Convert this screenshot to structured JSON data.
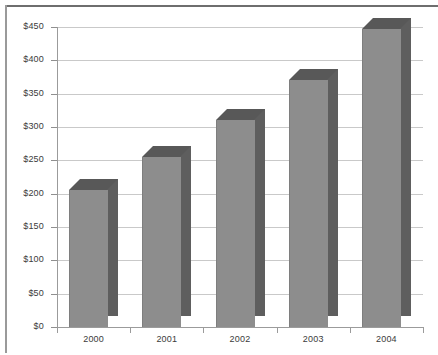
{
  "chart_data": {
    "type": "bar",
    "title": "",
    "subtitle": "",
    "xlabel": "",
    "ylabel": "",
    "categories": [
      "2000",
      "2001",
      "2002",
      "2003",
      "2004"
    ],
    "values": [
      205,
      255,
      310,
      370,
      447
    ],
    "series": [
      {
        "name": "",
        "values": [
          205,
          255,
          310,
          370,
          447
        ]
      }
    ],
    "ylim": [
      0,
      450
    ],
    "ytick_values": [
      0,
      50,
      100,
      150,
      200,
      250,
      300,
      350,
      400,
      450
    ],
    "ytick_labels": [
      "$0",
      "$50",
      "$100",
      "$150",
      "$200",
      "$250",
      "$300",
      "$350",
      "$400",
      "$450"
    ],
    "value_prefix": "$",
    "grid": true,
    "grid_axis": "y",
    "legend": false,
    "legend_position": "none",
    "three_d": true,
    "annotations": []
  },
  "style": {
    "bar_front_color": "#8d8d8d",
    "bar_top_color": "#585858",
    "bar_side_color": "#5e5e5e",
    "gridline_color": "#c9c9c9",
    "axis_color": "#9b9b9b",
    "text_color": "#3b3b3b",
    "background_color": "#ffffff",
    "border_color": "#6e6e6e"
  }
}
